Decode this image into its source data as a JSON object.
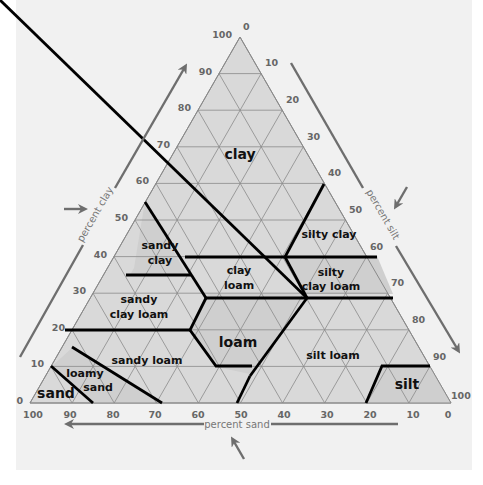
{
  "diagram": {
    "type": "ternary soil texture triangle",
    "axes": {
      "clay": {
        "label": "percent clay",
        "ticks": [
          "0",
          "10",
          "20",
          "30",
          "40",
          "50",
          "60",
          "70",
          "80",
          "90",
          "100"
        ]
      },
      "silt": {
        "label": "percent silt",
        "ticks": [
          "0",
          "10",
          "20",
          "30",
          "40",
          "50",
          "60",
          "70",
          "80",
          "90",
          "100"
        ]
      },
      "sand": {
        "label": "percent sand",
        "ticks": [
          "100",
          "90",
          "80",
          "70",
          "60",
          "50",
          "40",
          "30",
          "20",
          "10",
          "0"
        ]
      }
    },
    "regions": [
      {
        "name": "clay",
        "label": "clay"
      },
      {
        "name": "sandy-clay",
        "label1": "sandy",
        "label2": "clay"
      },
      {
        "name": "silty-clay",
        "label": "silty clay"
      },
      {
        "name": "sandy-clay-loam",
        "label1": "sandy",
        "label2": "clay loam"
      },
      {
        "name": "clay-loam",
        "label1": "clay",
        "label2": "loam"
      },
      {
        "name": "silty-clay-loam",
        "label1": "silty",
        "label2": "clay loam"
      },
      {
        "name": "loam",
        "label": "loam"
      },
      {
        "name": "sandy-loam",
        "label": "sandy loam"
      },
      {
        "name": "silt-loam",
        "label": "silt loam"
      },
      {
        "name": "loamy-sand",
        "label1": "loamy",
        "label2": "sand"
      },
      {
        "name": "sand",
        "label": "sand"
      },
      {
        "name": "silt",
        "label": "silt"
      }
    ],
    "colors": {
      "fill": "#d9d9d9",
      "fill_dark": "#cfcfcf",
      "grid": "#8a8a8a",
      "boundary": "#000000",
      "arrow": "#6e6e6e",
      "background": "#f1f1f1"
    }
  }
}
